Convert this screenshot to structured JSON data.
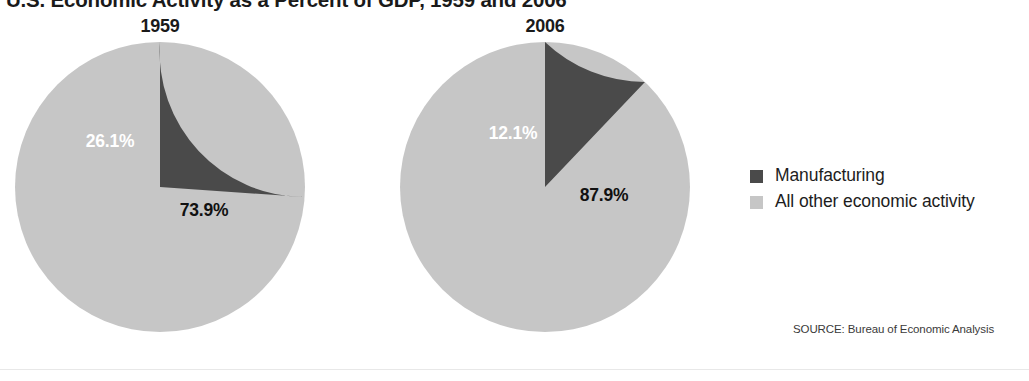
{
  "title": "U.S. Economic Activity as a Percent of GDP, 1959 and 2006",
  "source_note": "SOURCE: Bureau of Economic Analysis",
  "colors": {
    "manufacturing": "#4a4a4a",
    "all_other": "#c6c6c6",
    "background": "#ffffff",
    "label_on_dark": "#ffffff",
    "label_on_light": "#111111"
  },
  "legend": {
    "items": [
      {
        "label": "Manufacturing",
        "color": "#4a4a4a"
      },
      {
        "label": "All other economic activity",
        "color": "#c6c6c6"
      }
    ]
  },
  "pies": [
    {
      "year": "1959",
      "manufacturing_label": "26.1%",
      "all_other_label": "73.9%"
    },
    {
      "year": "2006",
      "manufacturing_label": "12.1%",
      "all_other_label": "87.9%"
    }
  ],
  "chart_data": {
    "type": "pie",
    "title": "U.S. Economic Activity as a Percent of GDP, 1959 and 2006",
    "subtitle": "",
    "xlabel": "",
    "ylabel": "",
    "units": "percent of GDP",
    "legend_position": "right",
    "grid": false,
    "annotations": [
      "SOURCE: Bureau of Economic Analysis"
    ],
    "categories": [
      "Manufacturing",
      "All other economic activity"
    ],
    "charts": [
      {
        "title": "1959",
        "labels": [
          "Manufacturing",
          "All other economic activity"
        ],
        "values": [
          26.1,
          73.9
        ],
        "value_labels": [
          "26.1%",
          "73.9%"
        ],
        "colors": [
          "#4a4a4a",
          "#c6c6c6"
        ],
        "start_angle_deg": 90,
        "direction": "counterclockwise"
      },
      {
        "title": "2006",
        "labels": [
          "Manufacturing",
          "All other economic activity"
        ],
        "values": [
          12.1,
          87.9
        ],
        "value_labels": [
          "12.1%",
          "87.9%"
        ],
        "colors": [
          "#4a4a4a",
          "#c6c6c6"
        ],
        "start_angle_deg": 90,
        "direction": "counterclockwise"
      }
    ]
  }
}
